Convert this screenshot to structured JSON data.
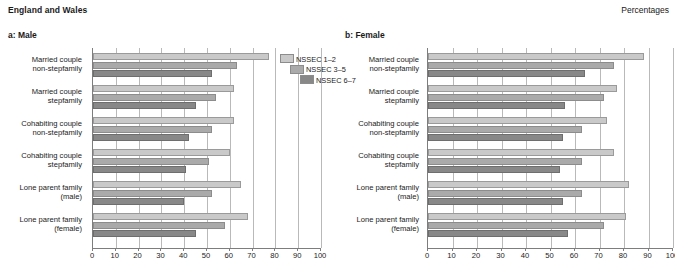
{
  "header": {
    "title": "England and Wales",
    "units": "Percentages"
  },
  "legend": {
    "items": [
      {
        "label": "NSSEC 1–2",
        "color": "#c9c9c9"
      },
      {
        "label": "NSSEC 3–5",
        "color": "#aaaaaa"
      },
      {
        "label": "NSSEC 6–7",
        "color": "#888888"
      }
    ]
  },
  "panels": [
    {
      "title": "a: Male"
    },
    {
      "title": "b: Female"
    }
  ],
  "chart_data": [
    {
      "type": "bar",
      "title": "a: Male",
      "orientation": "horizontal",
      "xlabel": "",
      "ylabel": "",
      "xlim": [
        0,
        100
      ],
      "xticks": [
        0,
        10,
        20,
        30,
        40,
        50,
        60,
        70,
        80,
        90,
        100
      ],
      "grid": true,
      "legend_position": "top-right",
      "categories": [
        "Married couple non-stepfamily",
        "Married couple stepfamily",
        "Cohabiting couple non-stepfamily",
        "Cohabiting couple stepfamily",
        "Lone parent family (male)",
        "Lone parent family (female)"
      ],
      "series": [
        {
          "name": "NSSEC 1–2",
          "values": [
            77,
            62,
            62,
            60,
            65,
            68
          ]
        },
        {
          "name": "NSSEC 3–5",
          "values": [
            63,
            54,
            52,
            51,
            52,
            58
          ]
        },
        {
          "name": "NSSEC 6–7",
          "values": [
            52,
            45,
            42,
            41,
            40,
            45
          ]
        }
      ]
    },
    {
      "type": "bar",
      "title": "b: Female",
      "orientation": "horizontal",
      "xlabel": "",
      "ylabel": "",
      "xlim": [
        0,
        100
      ],
      "xticks": [
        0,
        10,
        20,
        30,
        40,
        50,
        60,
        70,
        80,
        90,
        100
      ],
      "grid": true,
      "legend_position": "none",
      "categories": [
        "Married couple non-stepfamily",
        "Married couple stepfamily",
        "Cohabiting couple non-stepfamily",
        "Cohabiting couple stepfamily",
        "Lone parent family (male)",
        "Lone parent family (female)"
      ],
      "series": [
        {
          "name": "NSSEC 1–2",
          "values": [
            88,
            77,
            73,
            76,
            82,
            81
          ]
        },
        {
          "name": "NSSEC 3–5",
          "values": [
            76,
            72,
            63,
            63,
            63,
            72
          ]
        },
        {
          "name": "NSSEC 6–7",
          "values": [
            64,
            56,
            55,
            54,
            55,
            57
          ]
        }
      ]
    }
  ]
}
